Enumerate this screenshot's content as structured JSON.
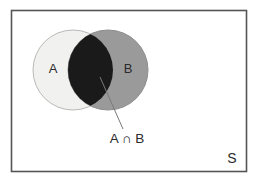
{
  "figure": {
    "kind": "venn-diagram",
    "title": "",
    "background_color": "#ffffff"
  },
  "universe": {
    "label": "S",
    "frame_border_color": "#555555",
    "frame_fill_color": "#ffffff"
  },
  "sets": [
    {
      "id": "A",
      "label": "A",
      "fill_color": "#f1f1ef",
      "stroke_color": "#b9b9b7",
      "label_color": "#2b2b2b"
    },
    {
      "id": "B",
      "label": "B",
      "fill_color": "#9a9a9a",
      "stroke_color": "#8d8d8d",
      "label_color": "#2b2b2b"
    }
  ],
  "region": {
    "label": "A ∩ B",
    "fill_color": "#1a1a1a",
    "leader_line_color": "#7a7a7a",
    "description": "intersection"
  }
}
